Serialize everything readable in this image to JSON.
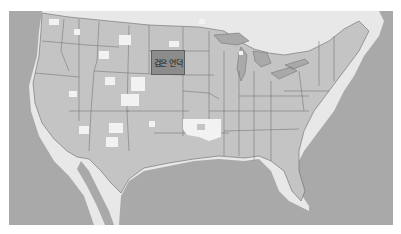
{
  "map": {
    "region": "contiguous-united-states",
    "highlight": {
      "label": "검은 언덕",
      "color": "#8c8c8c"
    },
    "colors": {
      "ocean": "#a9a9a9",
      "land_us": "#c4c4c4",
      "land_foreign": "#e8e8e8",
      "public_land": "#f2f2f2",
      "border": "#6a6a6a",
      "water_lakes": "#a9a9a9"
    }
  }
}
